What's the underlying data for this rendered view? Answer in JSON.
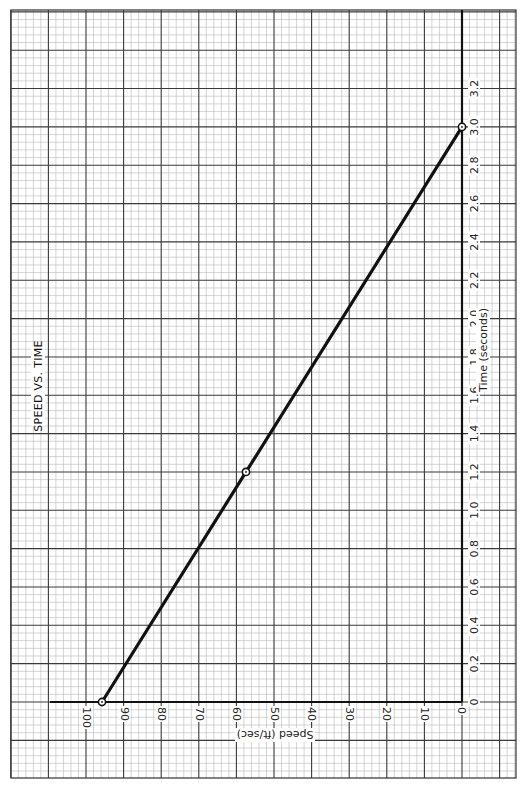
{
  "chart_data": {
    "type": "line",
    "title": "SPEED VS. TIME",
    "xlabel": "Time (seconds)",
    "ylabel": "Speed (ft/sec)",
    "orientation": "rotated 90° (time axis vertical on right, speed axis horizontal at bottom)",
    "x": [
      0,
      1.2,
      3.0
    ],
    "series": [
      {
        "name": "Speed",
        "values": [
          96,
          57.6,
          0
        ],
        "markers": "open circles"
      }
    ],
    "xlim": [
      0,
      3.2
    ],
    "ylim": [
      0,
      100
    ],
    "time_ticks": [
      "0",
      "0.2",
      "0.4",
      "0.6",
      "0.8",
      "1.0",
      "1.2",
      "1.4",
      "1.6",
      "1.8",
      "2.0",
      "2.2",
      "2.4",
      "2.6",
      "2.8",
      "3.0",
      "3.2"
    ],
    "speed_ticks": [
      "0",
      "10",
      "20",
      "30",
      "40",
      "50",
      "60",
      "70",
      "80",
      "90",
      "100"
    ],
    "grid": true,
    "legend": null
  },
  "labels": {
    "title": "SPEED VS. TIME",
    "time_axis": "Time (seconds)",
    "speed_axis": "Speed (ft/sec)"
  },
  "colors": {
    "minor_grid": "#b8b8b8",
    "major_grid": "#3a3a3a",
    "axis": "#111111",
    "line": "#111111"
  }
}
